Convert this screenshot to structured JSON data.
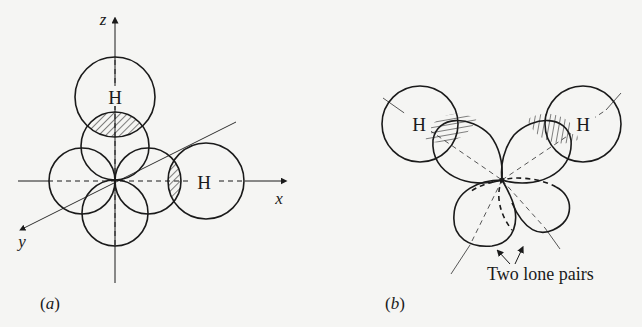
{
  "figure_a": {
    "caption": "(a)",
    "axis_labels": {
      "x": "x",
      "y": "y",
      "z": "z"
    },
    "atom_labels": [
      "H",
      "H"
    ],
    "description": "Oxygen p orbitals along x, y, z axes overlapping with two hydrogen 1s orbitals (shaded overlap regions)"
  },
  "figure_b": {
    "caption": "(b)",
    "atom_labels": [
      "H",
      "H"
    ],
    "annotation": "Two lone pairs",
    "description": "sp3 hybrid orbitals: two bonding to H (shaded overlap), two holding lone pairs"
  },
  "colors": {
    "ink": "#1a1a1a",
    "paper": "#f5f5f3"
  }
}
